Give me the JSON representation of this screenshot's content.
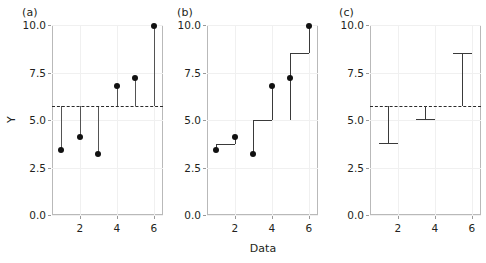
{
  "figure": {
    "axis_title_y": "Y",
    "axis_title_x": "Data",
    "y_ticks": [
      "0.0",
      "2.5",
      "5.0",
      "7.5",
      "10.0"
    ],
    "y_tick_values": [
      0.0,
      2.5,
      5.0,
      7.5,
      10.0
    ],
    "x_ticks": [
      "2",
      "4",
      "6"
    ],
    "x_tick_values": [
      2,
      4,
      6
    ]
  },
  "chart_data": [
    {
      "type": "scatter",
      "panel": "(a)",
      "title": "",
      "xlabel": "",
      "ylabel": "Y",
      "xlim": [
        0.5,
        6.5
      ],
      "ylim": [
        0.0,
        10.0
      ],
      "grid": true,
      "x": [
        1,
        2,
        3,
        4,
        5,
        6
      ],
      "values": [
        3.4,
        4.1,
        3.2,
        6.8,
        7.2,
        9.95
      ],
      "annotations": [
        {
          "kind": "hline",
          "label": "grand mean",
          "value": 5.75,
          "style": "dashed"
        }
      ],
      "series": [
        {
          "name": "observations",
          "values": [
            3.4,
            4.1,
            3.2,
            6.8,
            7.2,
            9.95
          ]
        },
        {
          "name": "deviation stems to grand mean",
          "values": [
            5.75,
            5.75,
            5.75,
            5.75,
            5.75,
            5.75
          ]
        }
      ]
    },
    {
      "type": "scatter",
      "panel": "(b)",
      "title": "",
      "xlabel": "Data",
      "ylabel": "Y",
      "xlim": [
        0.5,
        6.5
      ],
      "ylim": [
        0.0,
        10.0
      ],
      "grid": true,
      "x": [
        1,
        2,
        3,
        4,
        5,
        6
      ],
      "values": [
        3.4,
        4.1,
        3.2,
        6.8,
        7.2,
        9.95
      ],
      "series": [
        {
          "name": "observations",
          "values": [
            3.4,
            4.1,
            3.2,
            6.8,
            7.2,
            9.95
          ]
        },
        {
          "name": "step fit",
          "values": [
            3.75,
            3.75,
            5.0,
            5.0,
            8.55,
            8.55
          ]
        }
      ],
      "steps": [
        {
          "x_start": 1,
          "x_end": 2,
          "level": 3.75
        },
        {
          "x_start": 3,
          "x_end": 4,
          "level": 5.0
        },
        {
          "x_start": 5,
          "x_end": 6,
          "level": 8.55
        }
      ]
    },
    {
      "type": "scatter",
      "panel": "(c)",
      "title": "",
      "xlabel": "",
      "ylabel": "Y",
      "xlim": [
        0.5,
        6.5
      ],
      "ylim": [
        0.0,
        10.0
      ],
      "grid": true,
      "annotations": [
        {
          "kind": "hline",
          "label": "grand mean",
          "value": 5.75,
          "style": "dashed"
        }
      ],
      "series": [
        {
          "name": "group levels",
          "values": [
            3.8,
            5.05,
            8.55
          ]
        }
      ],
      "groups": [
        {
          "x_start": 1,
          "x_end": 2,
          "level": 3.8,
          "x_center": 1.45
        },
        {
          "x_start": 3,
          "x_end": 4,
          "level": 5.05,
          "x_center": 3.45
        },
        {
          "x_start": 5,
          "x_end": 6,
          "level": 8.55,
          "x_center": 5.45
        }
      ]
    }
  ],
  "panels": {
    "a": {
      "label": "(a)"
    },
    "b": {
      "label": "(b)"
    },
    "c": {
      "label": "(c)"
    }
  }
}
